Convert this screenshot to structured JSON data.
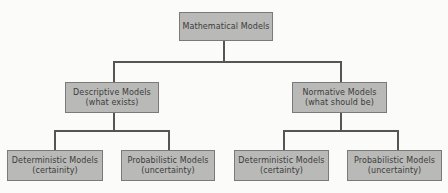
{
  "diagram": {
    "type": "hierarchy-tree",
    "colors": {
      "node_fill": "#b9b9b7",
      "node_border": "#7a7a78",
      "connector": "#555555",
      "text": "#3c3c3c",
      "background": "#fbfbfa"
    },
    "root": {
      "title": "Mathematical Models"
    },
    "level1": [
      {
        "title": "Descriptive Models",
        "subtitle": "(what exists)",
        "children": [
          {
            "title": "Deterministic Models",
            "subtitle": "(certainity)"
          },
          {
            "title": "Probabilistic Models",
            "subtitle": "(uncertainty)"
          }
        ]
      },
      {
        "title": "Normative Models",
        "subtitle": "(what should be)",
        "children": [
          {
            "title": "Deterministic Models",
            "subtitle": "(certainty)"
          },
          {
            "title": "Probabilistic Models",
            "subtitle": "(uncertainty)"
          }
        ]
      }
    ]
  }
}
